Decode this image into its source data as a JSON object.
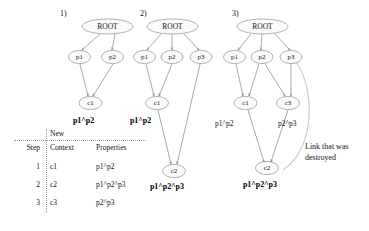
{
  "panels": [
    {
      "number": "1)",
      "nodes": [
        {
          "id": "root",
          "label": "ROOT"
        },
        {
          "id": "p1",
          "label": "p1"
        },
        {
          "id": "p2",
          "label": "p2"
        },
        {
          "id": "c1",
          "label": "c1"
        }
      ],
      "edges": [
        [
          "root",
          "p1"
        ],
        [
          "root",
          "p2"
        ],
        [
          "p1",
          "c1"
        ],
        [
          "p2",
          "c1"
        ]
      ],
      "annotations": [
        {
          "id": "c1_props",
          "text": "p1^p2",
          "style": "bold"
        }
      ]
    },
    {
      "number": "2)",
      "nodes": [
        {
          "id": "root",
          "label": "ROOT"
        },
        {
          "id": "p1",
          "label": "p1"
        },
        {
          "id": "p2",
          "label": "p2"
        },
        {
          "id": "p3",
          "label": "p3"
        },
        {
          "id": "c1",
          "label": "c1"
        },
        {
          "id": "c2",
          "label": "c2"
        }
      ],
      "edges": [
        [
          "root",
          "p1"
        ],
        [
          "root",
          "p2"
        ],
        [
          "root",
          "p3"
        ],
        [
          "p1",
          "c1"
        ],
        [
          "p2",
          "c1"
        ],
        [
          "c1",
          "c2"
        ],
        [
          "p3",
          "c2"
        ]
      ],
      "annotations": [
        {
          "id": "c1_props",
          "text": "p1^p2",
          "style": "bold"
        },
        {
          "id": "c2_props",
          "text": "p1^p2^p3",
          "style": "bold"
        }
      ]
    },
    {
      "number": "3)",
      "nodes": [
        {
          "id": "root",
          "label": "ROOT"
        },
        {
          "id": "p1",
          "label": "p1"
        },
        {
          "id": "p2",
          "label": "p2"
        },
        {
          "id": "p3",
          "label": "p3"
        },
        {
          "id": "c1",
          "label": "c1"
        },
        {
          "id": "c3",
          "label": "c3"
        },
        {
          "id": "c2",
          "label": "c2"
        }
      ],
      "edges": [
        [
          "root",
          "p1"
        ],
        [
          "root",
          "p2"
        ],
        [
          "root",
          "p3"
        ],
        [
          "p1",
          "c1"
        ],
        [
          "p2",
          "c1"
        ],
        [
          "p2",
          "c3"
        ],
        [
          "p3",
          "c3"
        ],
        [
          "c1",
          "c2"
        ],
        [
          "c3",
          "c2"
        ]
      ],
      "destroyed_edge": {
        "from": "p3",
        "to": "c2"
      },
      "annotations": [
        {
          "id": "c1_props",
          "text": "p1^p2",
          "style": "plain"
        },
        {
          "id": "c3_props",
          "text": "p2^p3",
          "style": "plain"
        },
        {
          "id": "c2_props",
          "text": "p1^p2^p3",
          "style": "bold"
        }
      ]
    }
  ],
  "callout": {
    "line1": "Link that was",
    "line2": "destroyed"
  },
  "table": {
    "header_new": "New",
    "columns": [
      "Step",
      "Context",
      "Properties"
    ],
    "rows": [
      {
        "step": "1",
        "context": "c1",
        "properties": "p1^p2"
      },
      {
        "step": "2",
        "context": "c2",
        "properties": "p1^p2^p3"
      },
      {
        "step": "3",
        "context": "c3",
        "properties": "p2^p3"
      }
    ]
  },
  "colors": {
    "node_fill": "#fbfbfb",
    "node_stroke": "#7d7d7d",
    "edge": "#6f6f6f",
    "destroyed_link": "#c9c9c9",
    "text": "#111111"
  }
}
